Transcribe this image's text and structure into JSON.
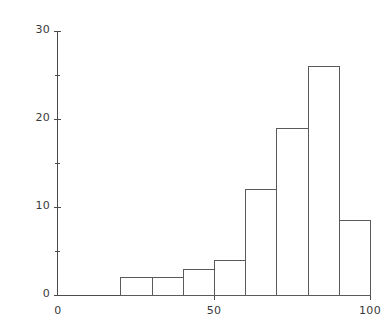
{
  "chart_data": {
    "type": "bar",
    "title": "",
    "subtitle": "",
    "xlabel": "",
    "ylabel": "",
    "xlim": [
      0,
      100
    ],
    "ylim": [
      0,
      30
    ],
    "grid": false,
    "legend": null,
    "bin_width": 10,
    "bin_edges": [
      20,
      30,
      40,
      50,
      60,
      70,
      80,
      90,
      100
    ],
    "categories": [
      "20-30",
      "30-40",
      "40-50",
      "50-60",
      "60-70",
      "70-80",
      "80-90",
      "90-100"
    ],
    "values": [
      2,
      2,
      3,
      4,
      12,
      19,
      26,
      8.5
    ],
    "x_ticks": [
      {
        "value": 0,
        "label": "0",
        "major": true
      },
      {
        "value": 50,
        "label": "50",
        "major": true
      },
      {
        "value": 100,
        "label": "100",
        "major": true
      }
    ],
    "y_ticks": [
      {
        "value": 0,
        "label": "0",
        "major": true
      },
      {
        "value": 5,
        "label": "",
        "major": false
      },
      {
        "value": 10,
        "label": "10",
        "major": true
      },
      {
        "value": 15,
        "label": "",
        "major": false
      },
      {
        "value": 20,
        "label": "20",
        "major": true
      },
      {
        "value": 25,
        "label": "",
        "major": false
      },
      {
        "value": 30,
        "label": "30",
        "major": true
      }
    ],
    "colors": {
      "bar_edge": "#5a5a5a",
      "bar_fill": "transparent",
      "axis": "#4a4a4a",
      "text": "#3a3a3a",
      "background": "#ffffff"
    }
  }
}
